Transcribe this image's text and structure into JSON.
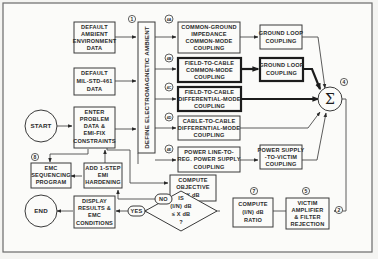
{
  "diagram": {
    "blocks": {
      "default_ambient": [
        "DEFAULT",
        "AMBIENT",
        "ENVIRONMENT",
        "DATA"
      ],
      "default_milstd": [
        "DEFAULT",
        "MIL-STD-461",
        "DATA"
      ],
      "enter_problem": [
        "ENTER",
        "PROBLEM",
        "DATA &",
        "EMI-FIX",
        "CONSTRAINTS"
      ],
      "start": "START",
      "end": "END",
      "define_ambient": "DEFINE ELECTROMAGNETIC AMBIENT",
      "common_ground": [
        "COMMON-GROUND",
        "IMPEDANCE",
        "COMMON-MODE",
        "COUPLING"
      ],
      "field_cable_cm": [
        "FIELD-TO-CABLE",
        "COMMON-MODE",
        "COUPLING"
      ],
      "field_cable_dm": [
        "FIELD-TO-CABLE",
        "DIFFERENTIAL-MODE",
        "COUPLING"
      ],
      "cable_cable_dm": [
        "CABLE-TO-CABLE",
        "DIFFERENTIAL-MODE",
        "COUPLING"
      ],
      "power_line": [
        "POWER LINE-TO-",
        "REG. POWER SUPPLY",
        "COUPLING"
      ],
      "ground_loop_1": [
        "GROUND LOOP",
        "COUPLING"
      ],
      "ground_loop_2": [
        "GROUND LOOP",
        "COUPLING"
      ],
      "power_supply_victim": [
        "POWER SUPPLY",
        "-TO-VICTIM",
        "COUPLING"
      ],
      "sum": "Σ",
      "compute_objective": [
        "COMPUTE",
        "OBJECTIVE",
        "X dB"
      ],
      "victim_amp": [
        "VICTIM",
        "AMPLIFIER",
        "& FILTER",
        "REJECTION"
      ],
      "compute_ratio": [
        "COMPUTE",
        "(I/N) dB",
        "RATIO"
      ],
      "decision": [
        "IS",
        "(I/N) dB",
        "≤ X dB",
        "?"
      ],
      "display_results": [
        "DISPLAY",
        "RESULTS &",
        "EMC",
        "CONDITIONS"
      ],
      "add_hardening": [
        "ADD 1-STEP",
        "EMI",
        "HARDENING"
      ],
      "emc_sequencing": [
        "EMC",
        "SEQUENCING",
        "PROGRAM"
      ],
      "yes": "YES",
      "no": "NO"
    },
    "tags": {
      "t1": "1",
      "t2": "2",
      "t4": "4",
      "t5": "5",
      "t7": "7",
      "t8": "8",
      "t4a": "4A",
      "t4b": "4B",
      "t4c": "4C",
      "t4d": "4D",
      "t4e": "4E"
    }
  }
}
